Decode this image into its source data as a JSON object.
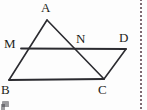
{
  "figure": {
    "kind": "geometry-diagram",
    "stroke_color": "#2b2b30",
    "label_color": "#1d1d20",
    "background_color": "#fdfdfd",
    "divider_color": "#7d6a72",
    "vertices": [
      {
        "id": "A",
        "label": "A",
        "x": 47,
        "y": 20
      },
      {
        "id": "M",
        "label": "M",
        "x": 21,
        "y": 48
      },
      {
        "id": "N",
        "label": "N",
        "x": 80,
        "y": 48
      },
      {
        "id": "D",
        "label": "D",
        "x": 126,
        "y": 49
      },
      {
        "id": "B",
        "label": "B",
        "x": 9,
        "y": 80
      },
      {
        "id": "C",
        "label": "C",
        "x": 104,
        "y": 79
      }
    ],
    "segments": [
      {
        "id": "AB",
        "from": "A",
        "to": "B"
      },
      {
        "id": "AC",
        "from": "A",
        "to": "C"
      },
      {
        "id": "BC",
        "from": "B",
        "to": "C"
      },
      {
        "id": "MD",
        "from": "M",
        "to": "D"
      },
      {
        "id": "CD",
        "from": "C",
        "to": "D"
      }
    ],
    "labels": {
      "A": "A",
      "M": "M",
      "N": "N",
      "D": "D",
      "B": "B",
      "C": "C"
    }
  }
}
